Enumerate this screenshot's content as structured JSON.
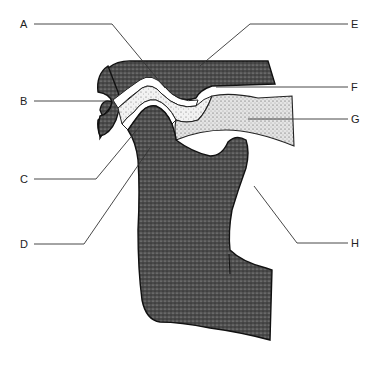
{
  "diagram": {
    "type": "anatomical-cross-section",
    "labels": [
      {
        "id": "A",
        "text": "A",
        "side": "left",
        "y": 24
      },
      {
        "id": "B",
        "text": "B",
        "side": "left",
        "y": 101
      },
      {
        "id": "C",
        "text": "C",
        "side": "left",
        "y": 179
      },
      {
        "id": "D",
        "text": "D",
        "side": "left",
        "y": 244
      },
      {
        "id": "E",
        "text": "E",
        "side": "right",
        "y": 24
      },
      {
        "id": "F",
        "text": "F",
        "side": "right",
        "y": 87
      },
      {
        "id": "G",
        "text": "G",
        "side": "right",
        "y": 119
      },
      {
        "id": "H",
        "text": "H",
        "side": "right",
        "y": 243
      }
    ],
    "colors": {
      "bone": "#3a3a3a",
      "disc": "#d8d8d8",
      "muscle": "#e6e6e6",
      "line": "#222222",
      "background": "#ffffff"
    }
  }
}
